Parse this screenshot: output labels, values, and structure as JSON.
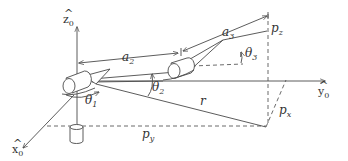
{
  "diagram": {
    "type": "robot-arm-kinematics",
    "colors": {
      "line": "#4a4a4a",
      "text": "#333333",
      "background": "#ffffff"
    },
    "axes": {
      "z": {
        "base": "z",
        "hat": "^",
        "sub": "0"
      },
      "y": {
        "base": "y",
        "hat": "^",
        "sub": "0"
      },
      "x": {
        "base": "x",
        "hat": "^",
        "sub": "0"
      }
    },
    "links": {
      "a2": {
        "base": "a",
        "sub": "2"
      },
      "a3": {
        "base": "a",
        "sub": "3"
      }
    },
    "angles": {
      "theta1": {
        "base": "θ",
        "sub": "1"
      },
      "theta2": {
        "base": "θ",
        "sub": "2"
      },
      "theta3": {
        "base": "θ",
        "sub": "3"
      }
    },
    "positions": {
      "px": {
        "base": "p",
        "sub": "x"
      },
      "py": {
        "base": "p",
        "sub": "y"
      },
      "pz": {
        "base": "p",
        "sub": "z"
      },
      "r": "r"
    }
  }
}
